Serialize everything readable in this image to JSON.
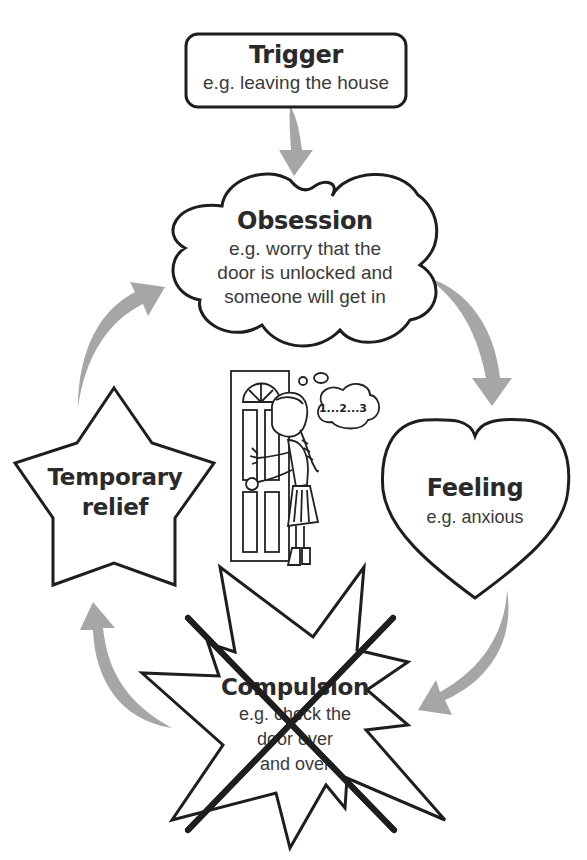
{
  "diagram": {
    "type": "cycle",
    "arrow_color": "#a6a6a6",
    "outline_color": "#1e1e1e",
    "nodes": {
      "trigger": {
        "title": "Trigger",
        "example": "e.g. leaving the house",
        "shape": "rounded-rectangle"
      },
      "obsession": {
        "title": "Obsession",
        "example_lines": [
          "e.g. worry that the",
          "door is unlocked and",
          "someone will get in"
        ],
        "shape": "cloud"
      },
      "feeling": {
        "title": "Feeling",
        "example": "e.g. anxious",
        "shape": "heart"
      },
      "compulsion": {
        "title": "Compulsion",
        "example_lines": [
          "e.g. check the",
          "door over",
          "and over"
        ],
        "shape": "starburst",
        "crossed_out": true
      },
      "relief": {
        "title_lines": [
          "Temporary",
          "relief"
        ],
        "shape": "star"
      }
    },
    "illustration": {
      "description": "girl touching a door while counting",
      "thought_text": "1...2...3"
    },
    "edges": [
      {
        "from": "trigger",
        "to": "obsession"
      },
      {
        "from": "obsession",
        "to": "feeling"
      },
      {
        "from": "feeling",
        "to": "compulsion"
      },
      {
        "from": "compulsion",
        "to": "relief"
      },
      {
        "from": "relief",
        "to": "obsession"
      }
    ]
  }
}
